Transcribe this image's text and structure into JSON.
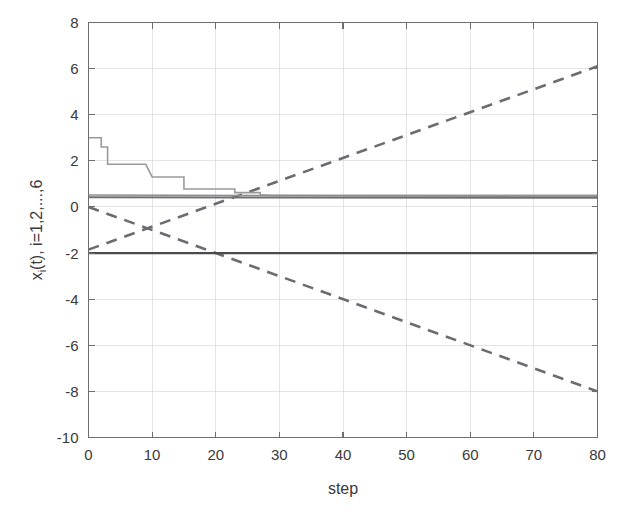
{
  "chart_data": {
    "type": "line",
    "title": "",
    "xlabel": "step",
    "ylabel": "x_i(t), i=1,2,...,6",
    "ylabel_parts": {
      "base": "x",
      "subscript": "i",
      "rest": "(t), i=1,2,...,6"
    },
    "xlim": [
      0,
      80
    ],
    "ylim": [
      -10,
      8
    ],
    "xticks": [
      0,
      10,
      20,
      30,
      40,
      50,
      60,
      70,
      80
    ],
    "yticks": [
      8,
      6,
      4,
      2,
      0,
      -2,
      -4,
      -6,
      -8,
      -10
    ],
    "xticklabels": [
      "0",
      "10",
      "20",
      "30",
      "40",
      "50",
      "60",
      "70",
      "80"
    ],
    "yticklabels": [
      "8",
      "6",
      "4",
      "2",
      "0",
      "-2",
      "-4",
      "-6",
      "-8",
      "-10"
    ],
    "grid": true,
    "legend": "none",
    "background": "#ffffff",
    "axis_color": "#6e6e6e",
    "grid_color": "#d8d8d8",
    "text_color": "#3a3a3a",
    "series": [
      {
        "name": "x1",
        "style": "dashed",
        "color": "#6b6b72",
        "width": 2.6,
        "dash": "11,8",
        "description": "rising dashed line from 0 at step 0 to 6.1 at step 80",
        "x": [
          0,
          80
        ],
        "values": [
          -1.85,
          6.1
        ]
      },
      {
        "name": "x2",
        "style": "dashed",
        "color": "#6b6b72",
        "width": 2.6,
        "dash": "11,8",
        "description": "falling dashed line from 0 at step 0 to -8.0 at step 80",
        "x": [
          0,
          80
        ],
        "values": [
          0.0,
          -8.0
        ]
      },
      {
        "name": "x3",
        "style": "solid",
        "color": "#9a9a9a",
        "width": 1.6,
        "dash": "none",
        "description": "descending staircase converging to 0.5",
        "x": [
          0,
          2,
          2,
          3,
          3,
          9,
          9,
          10,
          10,
          15,
          15,
          16,
          16,
          23,
          23,
          24,
          24,
          27,
          27,
          28,
          28,
          80
        ],
        "values": [
          3.0,
          3.0,
          2.6,
          2.6,
          1.85,
          1.85,
          1.85,
          1.3,
          1.3,
          1.3,
          0.78,
          0.78,
          0.78,
          0.78,
          0.62,
          0.62,
          0.62,
          0.62,
          0.52,
          0.52,
          0.5,
          0.5
        ]
      },
      {
        "name": "x4",
        "style": "solid",
        "color": "#8e8e8e",
        "width": 1.5,
        "dash": "none",
        "description": "flat line at 0.52",
        "x": [
          0,
          80
        ],
        "values": [
          0.52,
          0.45
        ]
      },
      {
        "name": "x5",
        "style": "solid",
        "color": "#707070",
        "width": 2.0,
        "dash": "none",
        "description": "flat line at 0.42",
        "x": [
          0,
          80
        ],
        "values": [
          0.42,
          0.4
        ]
      },
      {
        "name": "x6",
        "style": "solid",
        "color": "#4a4a4a",
        "width": 2.2,
        "dash": "none",
        "description": "flat solid dark line at -2.0",
        "x": [
          0,
          80
        ],
        "values": [
          -2.0,
          -2.0
        ]
      }
    ]
  }
}
